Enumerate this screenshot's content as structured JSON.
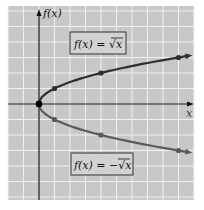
{
  "figure": {
    "y_axis_label": "f(x)",
    "x_axis_label": "x",
    "upper_label": "f(x) = √x",
    "lower_label": "f(x) = −√x",
    "colors": {
      "background": "#c8c8c8",
      "grid": "#f2f2f2",
      "axis": "#111111",
      "curve": "#3a3a3a",
      "label_bg": "#d2d2d2",
      "label_border": "#333333"
    }
  },
  "chart_data": {
    "type": "line",
    "title": "",
    "xlabel": "x",
    "ylabel": "f(x)",
    "xlim": [
      -2,
      10
    ],
    "ylim": [
      -6,
      6
    ],
    "grid": true,
    "series": [
      {
        "name": "f(x) = √x",
        "x": [
          0,
          1,
          4,
          9
        ],
        "y": [
          0,
          1,
          2,
          3
        ]
      },
      {
        "name": "f(x) = −√x",
        "x": [
          0,
          1,
          4,
          9
        ],
        "y": [
          0,
          -1,
          -2,
          -3
        ]
      }
    ]
  }
}
